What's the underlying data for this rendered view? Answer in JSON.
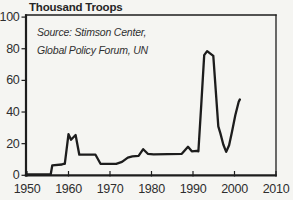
{
  "chart": {
    "title": "Thousand Troops",
    "source_line1": "Source: Stimson Center,",
    "source_line2": "Global Policy Forum, UN",
    "colors": {
      "line": "#1d1d1d",
      "frame": "#1d1d1d",
      "tick": "#1d1d1d",
      "tick_text": "#2e2e2e",
      "background": "#f5f5f2"
    }
  },
  "chart_data": {
    "type": "line",
    "title": "Thousand Troops",
    "y_axis_title": "Thousand Troops",
    "source": "Source: Stimson Center, Global Policy Forum, UN",
    "xlim": [
      1950,
      2010
    ],
    "ylim": [
      0,
      100
    ],
    "x_ticks": [
      1950,
      1960,
      1970,
      1980,
      1990,
      2000,
      2010
    ],
    "y_ticks": [
      0,
      20,
      40,
      60,
      80,
      100
    ],
    "grid": false,
    "legend": false,
    "frame": "box",
    "series": [
      {
        "name": "troops",
        "x": [
          1950,
          1955.7,
          1956.1,
          1958.4,
          1958.8,
          1959.1,
          1960.0,
          1960.6,
          1961.7,
          1962.6,
          1966.5,
          1967.7,
          1971.5,
          1972.9,
          1974.3,
          1975.4,
          1976.9,
          1978.0,
          1979.1,
          1980.5,
          1987.3,
          1988.8,
          1989.7,
          1990.9,
          1991.3,
          1992.0,
          1992.7,
          1993.4,
          1994.9,
          1996.1,
          1996.6,
          1997.3,
          1998.0,
          1998.7,
          1999.4,
          2000.2,
          2001.0,
          2001.3
        ],
        "y": [
          0.5,
          0.5,
          6.3,
          6.8,
          7.2,
          7.2,
          26,
          22.5,
          25.5,
          13,
          13,
          7.3,
          7.3,
          8.5,
          11.2,
          12,
          12.3,
          16.5,
          13.6,
          13.2,
          13.6,
          18,
          15.2,
          15.5,
          15.2,
          45,
          76,
          78.5,
          75.5,
          31,
          26.5,
          19.5,
          14.8,
          19,
          27.5,
          38,
          46.5,
          48
        ]
      }
    ]
  }
}
